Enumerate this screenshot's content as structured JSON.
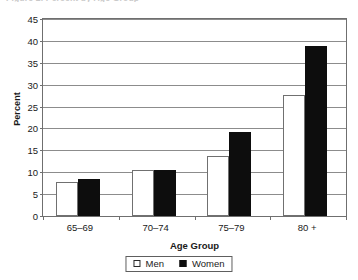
{
  "figure": {
    "cropped_title_sliver": "Figure 2. Percent by Age Group"
  },
  "chart_data": {
    "type": "bar",
    "title": "",
    "xlabel": "Age Group",
    "ylabel": "Percent",
    "categories": [
      "65–69",
      "70–74",
      "75–79",
      "80 +"
    ],
    "series": [
      {
        "name": "Men",
        "color": "#ffffff",
        "values": [
          7.7,
          10.4,
          13.6,
          27.6
        ]
      },
      {
        "name": "Women",
        "color": "#0d0d0d",
        "values": [
          8.4,
          10.4,
          19.1,
          38.8
        ]
      }
    ],
    "ylim": [
      0,
      45
    ],
    "ytick_labels": [
      "0",
      "5",
      "10",
      "15",
      "20",
      "25",
      "30",
      "35",
      "40",
      "45"
    ],
    "ytick_values": [
      0,
      5,
      10,
      15,
      20,
      25,
      30,
      35,
      40,
      45
    ],
    "grid": "horizontal",
    "legend_position": "bottom",
    "legend": [
      {
        "label": "Men",
        "swatch": "hollow-square"
      },
      {
        "label": "Women",
        "swatch": "filled-square"
      }
    ]
  }
}
